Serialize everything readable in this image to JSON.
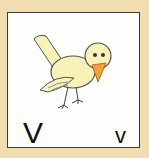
{
  "card": {
    "uppercase_letter": "V",
    "lowercase_letter": "v",
    "illustration": "bird-icon",
    "colors": {
      "background": "#f2ddb0",
      "card": "#fdfdfb",
      "bird_body": "#f6f2b8",
      "beak": "#f0a040",
      "outline": "#3a3a3a"
    }
  }
}
